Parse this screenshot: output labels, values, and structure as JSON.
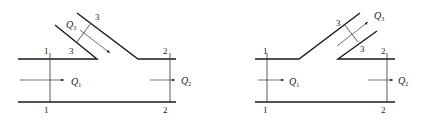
{
  "diagrams": [
    {
      "name": "converging-tee",
      "sections": {
        "s1": "1",
        "s2": "2",
        "s3": "3"
      },
      "flows": {
        "q1": "Q",
        "q1_sub": "1",
        "q2": "Q",
        "q2_sub": "2",
        "q3": "Q",
        "q3_sub": "3"
      }
    },
    {
      "name": "diverging-tee",
      "sections": {
        "s1": "1",
        "s2": "2",
        "s3": "3"
      },
      "flows": {
        "q1": "Q",
        "q1_sub": "1",
        "q2": "Q",
        "q2_sub": "2",
        "q3": "Q",
        "q3_sub": "3"
      }
    }
  ],
  "colors": {
    "line": "#1a1a1a",
    "background": "#ffffff"
  }
}
